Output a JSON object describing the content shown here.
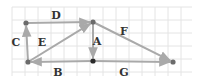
{
  "diagram": {
    "type": "vector-graph",
    "grid": {
      "x0": 12,
      "y0": 7,
      "x1": 192,
      "y1": 76,
      "step": 13,
      "color": "#e4e4e4"
    },
    "colors": {
      "edge": "#a9a9a9",
      "node": "#6b6b6b",
      "node_dark": "#2a2a2a",
      "label": "#333333"
    },
    "nodes": [
      {
        "id": "TL",
        "x": 26,
        "y": 23,
        "dark": false
      },
      {
        "id": "TM",
        "x": 93,
        "y": 22,
        "dark": false
      },
      {
        "id": "BL",
        "x": 28,
        "y": 62,
        "dark": false
      },
      {
        "id": "BM",
        "x": 93,
        "y": 61,
        "dark": true
      },
      {
        "id": "BR",
        "x": 173,
        "y": 62,
        "dark": false
      }
    ],
    "edges": [
      {
        "label": "A",
        "from": "TM",
        "to": "BM",
        "lx": 97,
        "ly": 45
      },
      {
        "label": "B",
        "from": "BM",
        "to": "BL",
        "lx": 58,
        "ly": 76
      },
      {
        "label": "C",
        "from": "BL",
        "to": "TL",
        "lx": 16,
        "ly": 46
      },
      {
        "label": "D",
        "from": "TL",
        "to": "TM",
        "lx": 56,
        "ly": 19
      },
      {
        "label": "E",
        "from": "BL",
        "to": "TM",
        "lx": 42,
        "ly": 46
      },
      {
        "label": "F",
        "from": "TM",
        "to": "BR",
        "lx": 124,
        "ly": 35
      },
      {
        "label": "G",
        "from": "BM",
        "to": "BR",
        "lx": 124,
        "ly": 76
      }
    ]
  }
}
